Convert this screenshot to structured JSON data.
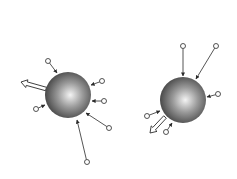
{
  "diagram": {
    "colors": {
      "background": "#ffffff",
      "sphere_light": "#f4f4f4",
      "sphere_mid": "#8a8a8a",
      "sphere_dark": "#3a3a3a",
      "line": "#2a2a2a",
      "particle_fill": "#ffffff"
    },
    "spheres": [
      {
        "id": "left",
        "cx": 68,
        "cy": 95,
        "r": 23,
        "particles": [
          {
            "px": 48,
            "py": 61,
            "tx": 57,
            "ty": 73
          },
          {
            "px": 102,
            "py": 81,
            "tx": 91,
            "ty": 85
          },
          {
            "px": 104,
            "py": 101,
            "tx": 92,
            "ty": 101
          },
          {
            "px": 36,
            "py": 109,
            "tx": 45,
            "ty": 105
          },
          {
            "px": 109,
            "py": 128,
            "tx": 86,
            "ty": 113
          },
          {
            "px": 87,
            "py": 162,
            "tx": 77,
            "ty": 120
          }
        ],
        "net_arrow": {
          "x1": 46,
          "y1": 89,
          "x2": 21,
          "y2": 82
        }
      },
      {
        "id": "right",
        "cx": 183,
        "cy": 100,
        "r": 23,
        "particles": [
          {
            "px": 183,
            "py": 46,
            "tx": 183,
            "ty": 76
          },
          {
            "px": 216,
            "py": 46,
            "tx": 196,
            "ty": 79
          },
          {
            "px": 218,
            "py": 94,
            "tx": 207,
            "ty": 97
          },
          {
            "px": 147,
            "py": 116,
            "tx": 160,
            "ty": 111
          },
          {
            "px": 166,
            "py": 132,
            "tx": 172,
            "ty": 123
          }
        ],
        "net_arrow": {
          "x1": 165,
          "y1": 117,
          "x2": 150,
          "y2": 133
        }
      }
    ]
  }
}
